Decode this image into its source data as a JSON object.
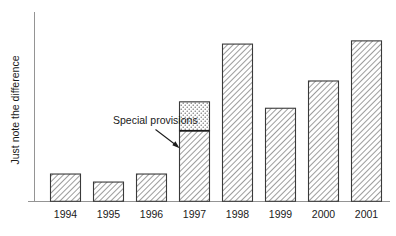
{
  "chart_data": {
    "type": "bar",
    "title": "",
    "subtitle": "",
    "xlabel": "",
    "ylabel": "Just note the difference",
    "categories": [
      "1994",
      "1995",
      "1996",
      "1997",
      "1998",
      "1999",
      "2000",
      "2001"
    ],
    "series": [
      {
        "name": "Base",
        "fill": "diagonal-hatch",
        "values": [
          17,
          12,
          17,
          44,
          98,
          58,
          75,
          100
        ]
      },
      {
        "name": "Special provisions",
        "fill": "dotted-stipple",
        "values": [
          0,
          0,
          0,
          18,
          0,
          0,
          0,
          0
        ]
      }
    ],
    "totals": [
      17,
      12,
      17,
      62,
      98,
      58,
      75,
      100
    ],
    "ylim": [
      0,
      118
    ],
    "xlim_note": "categorical",
    "grid": false,
    "y_ticks": [],
    "y_tick_labels": [],
    "legend": "none",
    "legend_position": "none",
    "annotations": [
      {
        "text": "Special provisions",
        "target_category": "1997",
        "target_segment": "Special provisions",
        "arrow": true
      }
    ],
    "axis_color": "#949494",
    "bar_outline_color": "#3a3a3a",
    "divider_color": "#1c1c1c",
    "background_color": "#ffffff",
    "text_color": "#1a1a1a"
  },
  "axes": {
    "y_axis_label": "Just note the difference",
    "x_tick_labels": [
      "1994",
      "1995",
      "1996",
      "1997",
      "1998",
      "1999",
      "2000",
      "2001"
    ]
  },
  "annotation": {
    "label": "Special provisions"
  }
}
